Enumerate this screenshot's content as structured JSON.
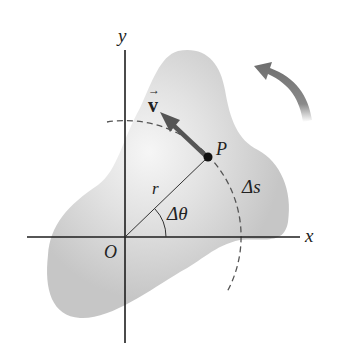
{
  "figure": {
    "colors": {
      "body_fill": "#c8c8c8",
      "body_highlight": "#f4f4f4",
      "axes": "#1e1e1e",
      "arrow": "#5a5a5a",
      "rotation_arrow": "#6e6e6e",
      "dashed_arc": "#555555"
    },
    "labels": {
      "y_axis": "y",
      "x_axis": "x",
      "origin": "O",
      "point": "P",
      "radius": "r",
      "angle": "Δθ",
      "arc_length": "Δs",
      "velocity": "v",
      "velocity_arrow_accent": "→"
    },
    "rotation_direction": "counterclockwise"
  }
}
